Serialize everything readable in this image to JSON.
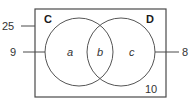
{
  "diagram": {
    "type": "venn",
    "universal": {
      "total_label": "25",
      "outside_count": "10"
    },
    "sets": [
      {
        "name": "C",
        "only_count_label": "9"
      },
      {
        "name": "D",
        "only_count_label": "8"
      }
    ],
    "regions": {
      "c_only": "a",
      "intersection": "b",
      "d_only": "c"
    }
  }
}
